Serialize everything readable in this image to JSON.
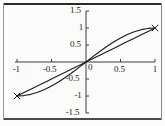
{
  "figure": {
    "background_color": "#fbfbfa",
    "border_color": "#2a2a2a",
    "axis_color": "#3c3c3c",
    "curve_color": "#1a1a1a"
  },
  "axes": {
    "x_ticks": [
      {
        "value": -1,
        "label": "-1"
      },
      {
        "value": -0.5,
        "label": "-0.5"
      },
      {
        "value": 0.5,
        "label": "0.5"
      },
      {
        "value": 1,
        "label": "1"
      }
    ],
    "y_ticks": [
      {
        "value": 1.5,
        "label": "1.5"
      },
      {
        "value": 1,
        "label": "1"
      },
      {
        "value": 0.5,
        "label": "0.5"
      },
      {
        "value": -0.5,
        "label": "-0.5"
      },
      {
        "value": -1,
        "label": "-1"
      },
      {
        "value": -1.5,
        "label": "-1.5"
      }
    ],
    "origin_label": "0"
  },
  "chart_data": {
    "type": "line",
    "title": "",
    "subtitle": "",
    "xlabel": "",
    "ylabel": "",
    "xlim": [
      -1,
      1
    ],
    "ylim": [
      -1.5,
      1.5
    ],
    "grid": false,
    "legend": "none",
    "x_ticks": [
      -1,
      -0.5,
      0.5,
      1
    ],
    "y_ticks": [
      1.5,
      1,
      0.5,
      -0.5,
      -1,
      -1.5
    ],
    "x": [
      -1,
      -0.9,
      -0.8,
      -0.7,
      -0.6,
      -0.5,
      -0.4,
      -0.3,
      -0.2,
      -0.1,
      0,
      0.1,
      0.2,
      0.3,
      0.4,
      0.5,
      0.6,
      0.7,
      0.8,
      0.9,
      1
    ],
    "series": [
      {
        "name": "sine-like curve",
        "values": [
          -1,
          -0.9877,
          -0.9511,
          -0.891,
          -0.809,
          -0.7071,
          -0.5878,
          -0.454,
          -0.309,
          -0.1564,
          0,
          0.1564,
          0.309,
          0.454,
          0.5878,
          0.7071,
          0.809,
          0.891,
          0.9511,
          0.9877,
          1
        ]
      },
      {
        "name": "linear curve",
        "values": [
          -1,
          -0.9,
          -0.8,
          -0.7,
          -0.6,
          -0.5,
          -0.4,
          -0.3,
          -0.2,
          -0.1,
          0,
          0.1,
          0.2,
          0.3,
          0.4,
          0.5,
          0.6,
          0.7,
          0.8,
          0.9,
          1
        ]
      }
    ],
    "endpoint_markers": [
      {
        "x": -1,
        "y": -1
      },
      {
        "x": 1,
        "y": 1
      }
    ]
  }
}
